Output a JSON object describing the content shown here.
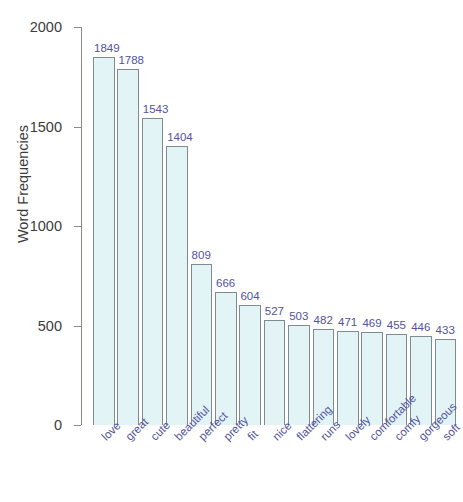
{
  "chart_data": {
    "type": "bar",
    "title": "",
    "xlabel": "",
    "ylabel": "Word Frequencies",
    "ylim": [
      0,
      2000
    ],
    "yticks": [
      0,
      500,
      1000,
      1500,
      2000
    ],
    "ytick_labels": [
      "0",
      "500",
      "1000",
      "1500",
      "2000"
    ],
    "grid": false,
    "legend": null,
    "bar_fill_color": "#e2f4f6",
    "bar_edge_color": "#808a8f",
    "value_label_color": "#52529c",
    "tick_label_color": "#3c3c3c",
    "categories": [
      "love",
      "great",
      "cute",
      "beautiful",
      "perfect",
      "pretty",
      "fit",
      "nice",
      "flattering",
      "runs",
      "lovely",
      "comfortable",
      "comfy",
      "gorgeous",
      "soft"
    ],
    "values": [
      1849,
      1788,
      1543,
      1404,
      809,
      666,
      604,
      527,
      503,
      482,
      471,
      469,
      455,
      446,
      433
    ],
    "value_labels": [
      "1849",
      "1788",
      "1543",
      "1404",
      "809",
      "666",
      "604",
      "527",
      "503",
      "482",
      "471",
      "469",
      "455",
      "446",
      "433"
    ]
  }
}
